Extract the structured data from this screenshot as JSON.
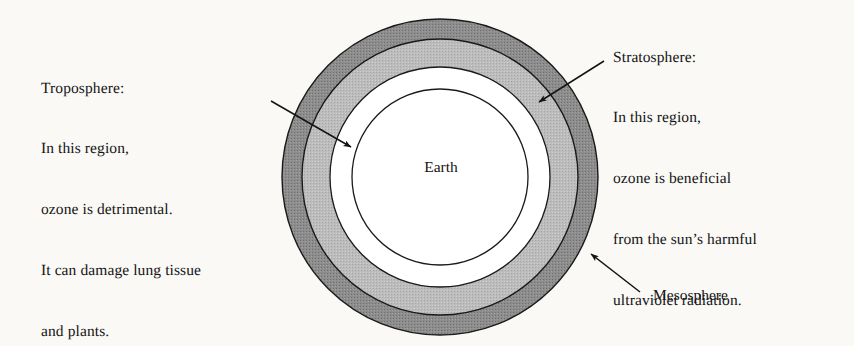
{
  "figure": {
    "background_color": "#faf9f6",
    "ink_color": "#141414"
  },
  "center_label": {
    "text": "Earth"
  },
  "rings": [
    {
      "name": "mesosphere",
      "label": "Mesosphere",
      "fill": "#8d8d8d",
      "stroke": "#1a1a1a",
      "outer_radius": 158,
      "inner_radius": 138
    },
    {
      "name": "stratosphere",
      "label": "Stratosphere",
      "fill": "#bcbcbc",
      "stroke": "#1a1a1a",
      "outer_radius": 138,
      "inner_radius": 110
    },
    {
      "name": "troposphere",
      "label": "Troposphere",
      "fill": "#ffffff",
      "stroke": "#1a1a1a",
      "outer_radius": 110,
      "inner_radius": 88
    },
    {
      "name": "earth",
      "label": "Earth",
      "fill": "#ffffff",
      "stroke": "#1a1a1a",
      "outer_radius": 88,
      "inner_radius": 0
    }
  ],
  "callouts": {
    "troposphere": {
      "heading": "Troposphere:",
      "lines": [
        "Troposphere:",
        "In this region,",
        "ozone is detrimental.",
        "It can damage lung tissue",
        "and plants."
      ]
    },
    "stratosphere": {
      "heading": "Stratosphere:",
      "lines": [
        "Stratosphere:",
        "In this region,",
        "ozone is beneficial",
        "from the sun’s harmful",
        "ultraviolet radiation."
      ]
    },
    "mesosphere": {
      "heading": "Mesosphere",
      "lines": [
        "Mesosphere"
      ]
    }
  },
  "arrows": [
    {
      "name": "troposphere-arrow",
      "from": [
        271,
        101
      ],
      "to": [
        354,
        149
      ],
      "points_to": "troposphere"
    },
    {
      "name": "stratosphere-arrow",
      "from": [
        604,
        61
      ],
      "to": [
        536,
        104
      ],
      "points_to": "stratosphere"
    },
    {
      "name": "mesosphere-arrow",
      "from": [
        640,
        292
      ],
      "to": [
        588,
        251
      ],
      "points_to": "mesosphere"
    }
  ]
}
